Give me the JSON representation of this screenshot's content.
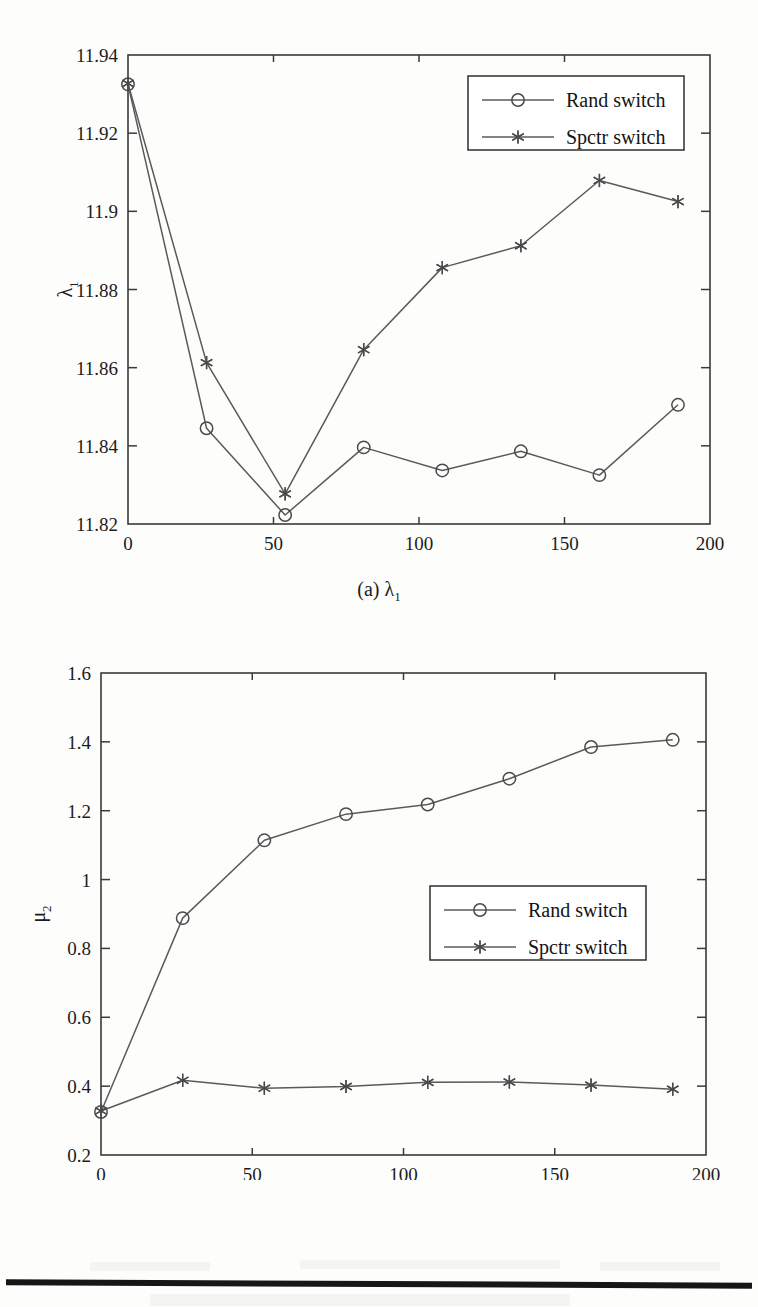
{
  "page": {
    "background_color": "#fdfdfc",
    "line_color": "#5a5a5a",
    "axis_color": "#3a3a3a",
    "text_color": "#1c1c1c"
  },
  "figures": [
    {
      "id": "a",
      "caption_prefix": "(a)",
      "caption_symbol": "λ",
      "caption_subscript": "1"
    },
    {
      "id": "b",
      "caption_prefix": "(b)",
      "caption_symbol": "μ",
      "caption_subscript": "2"
    }
  ],
  "chart_data": [
    {
      "type": "line",
      "title": "(a) λ1",
      "xlabel": "k",
      "ylabel": "λ1",
      "ylabel_symbol": "λ",
      "ylabel_subscript": "1",
      "xlim": [
        0,
        200
      ],
      "ylim": [
        11.82,
        11.94
      ],
      "xticks": [
        0,
        50,
        100,
        150,
        200
      ],
      "xtick_labels": [
        "0",
        "50",
        "100",
        "150",
        "200"
      ],
      "yticks": [
        11.82,
        11.84,
        11.86,
        11.88,
        11.9,
        11.92,
        11.94
      ],
      "ytick_labels": [
        "11.82",
        "11.84",
        "11.86",
        "11.88",
        "11.9",
        "11.92",
        "11.94"
      ],
      "grid": false,
      "legend_position": "top-right",
      "x": [
        0,
        27,
        54,
        81,
        108,
        135,
        162,
        189
      ],
      "series": [
        {
          "name": "Rand switch",
          "marker": "circle",
          "values": [
            11.9325,
            11.8445,
            11.8223,
            11.8396,
            11.8337,
            11.8386,
            11.8325,
            11.8505
          ]
        },
        {
          "name": "Spctr switch",
          "marker": "asterisk",
          "values": [
            11.9327,
            11.8613,
            11.8277,
            11.8646,
            11.8856,
            11.8912,
            11.9079,
            11.9025
          ]
        }
      ]
    },
    {
      "type": "line",
      "title": "(b) μ2",
      "xlabel": "k",
      "ylabel": "μ2",
      "ylabel_symbol": "μ",
      "ylabel_subscript": "2",
      "xlim": [
        0,
        200
      ],
      "ylim": [
        0.2,
        1.6
      ],
      "xticks": [
        0,
        50,
        100,
        150,
        200
      ],
      "xtick_labels": [
        "0",
        "50",
        "100",
        "150",
        "200"
      ],
      "yticks": [
        0.2,
        0.4,
        0.6,
        0.8,
        1.0,
        1.2,
        1.4,
        1.6
      ],
      "ytick_labels": [
        "0.2",
        "0.4",
        "0.6",
        "0.8",
        "1",
        "1.2",
        "1.4",
        "1.6"
      ],
      "grid": false,
      "legend_position": "center-right",
      "x": [
        0,
        27,
        54,
        81,
        108,
        135,
        162,
        189
      ],
      "series": [
        {
          "name": "Rand switch",
          "marker": "circle",
          "values": [
            0.325,
            0.888,
            1.114,
            1.19,
            1.218,
            1.293,
            1.385,
            1.406
          ]
        },
        {
          "name": "Spctr switch",
          "marker": "asterisk",
          "values": [
            0.328,
            0.417,
            0.394,
            0.399,
            0.411,
            0.412,
            0.403,
            0.391
          ]
        }
      ]
    }
  ]
}
